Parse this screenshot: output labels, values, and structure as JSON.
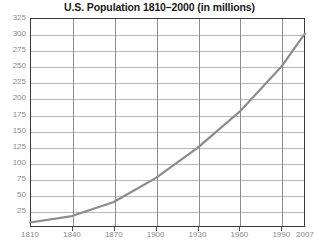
{
  "chart_data": {
    "type": "line",
    "title": "U.S. Population 1810–2000 (in millions)",
    "xlabel": "",
    "ylabel": "",
    "xlim": [
      1810,
      2007
    ],
    "ylim": [
      0,
      325
    ],
    "grid": true,
    "legend": null,
    "line_color": "#8c8c8c",
    "xticks": [
      "1810",
      "1840",
      "1870",
      "1900",
      "1930",
      "1960",
      "1990",
      "2007"
    ],
    "xtick_values": [
      1810,
      1840,
      1870,
      1900,
      1930,
      1960,
      1990,
      2007
    ],
    "yticks": [
      "25",
      "50",
      "75",
      "100",
      "125",
      "150",
      "175",
      "200",
      "225",
      "250",
      "275",
      "300",
      "325"
    ],
    "ytick_values": [
      25,
      50,
      75,
      100,
      125,
      150,
      175,
      200,
      225,
      250,
      275,
      300,
      325
    ],
    "x": [
      1810,
      1840,
      1870,
      1900,
      1930,
      1960,
      1990,
      2007
    ],
    "values": [
      7,
      17,
      39,
      76,
      123,
      179,
      249,
      301
    ],
    "series": [
      {
        "name": "U.S. Population",
        "x": [
          1810,
          1840,
          1870,
          1900,
          1930,
          1960,
          1990,
          2007
        ],
        "values": [
          7,
          17,
          39,
          76,
          123,
          179,
          249,
          301
        ]
      }
    ]
  },
  "colors": {
    "title": "#1a1a1a",
    "axis_label": "#8a8a8a",
    "frame": "#3a3a3a",
    "gridline_h": "#b9b9b9",
    "gridline_v": "#8e8e8e",
    "line": "#8c8c8c",
    "background": "#ffffff"
  }
}
